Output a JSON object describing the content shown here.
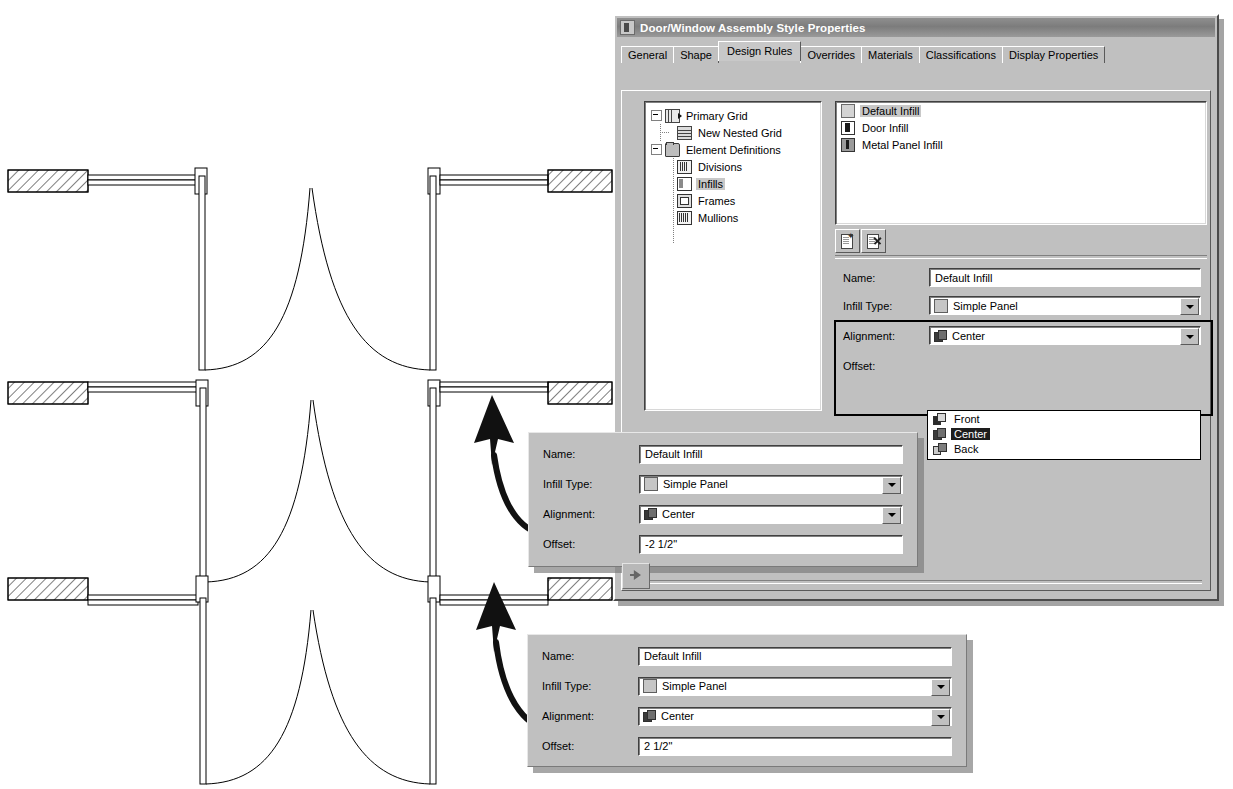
{
  "dialog": {
    "title": "Door/Window Assembly Style Properties",
    "title_icon": "door-window-assembly-icon",
    "tabs": [
      {
        "label": "General",
        "active": false
      },
      {
        "label": "Shape",
        "active": false
      },
      {
        "label": "Design Rules",
        "active": true
      },
      {
        "label": "Overrides",
        "active": false
      },
      {
        "label": "Materials",
        "active": false
      },
      {
        "label": "Classifications",
        "active": false
      },
      {
        "label": "Display Properties",
        "active": false
      }
    ],
    "tree": {
      "nodes": [
        {
          "label": "Primary Grid",
          "icon": "primary-grid-icon",
          "depth": 0,
          "expander": "minus",
          "selected": false
        },
        {
          "label": "New Nested Grid",
          "icon": "nested-grid-icon",
          "depth": 1,
          "expander": "none",
          "selected": false
        },
        {
          "label": "Element Definitions",
          "icon": "folder-icon",
          "depth": 0,
          "expander": "minus",
          "selected": false
        },
        {
          "label": "Divisions",
          "icon": "divisions-icon",
          "depth": 1,
          "expander": "none",
          "selected": false
        },
        {
          "label": "Infills",
          "icon": "infills-icon",
          "depth": 1,
          "expander": "none",
          "selected": true
        },
        {
          "label": "Frames",
          "icon": "frames-icon",
          "depth": 1,
          "expander": "none",
          "selected": false
        },
        {
          "label": "Mullions",
          "icon": "mullions-icon",
          "depth": 1,
          "expander": "none",
          "selected": false
        }
      ]
    },
    "list": {
      "items": [
        {
          "label": "Default Infill",
          "icon": "default-infill-icon",
          "selected": true
        },
        {
          "label": "Door Infill",
          "icon": "door-infill-icon",
          "selected": false
        },
        {
          "label": "Metal Panel Infill",
          "icon": "metal-panel-infill-icon",
          "selected": false
        }
      ]
    },
    "toolbar": {
      "new_label": "New",
      "delete_label": "Delete"
    },
    "form": {
      "name_label": "Name:",
      "name_value": "Default Infill",
      "infill_type_label": "Infill Type:",
      "infill_type_value": "Simple Panel",
      "alignment_label": "Alignment:",
      "alignment_value": "Center",
      "offset_label": "Offset:",
      "offset_value": "",
      "alignment_options": [
        {
          "label": "Front",
          "icon": "align-front-icon",
          "selected": false
        },
        {
          "label": "Center",
          "icon": "align-center-icon",
          "selected": true
        },
        {
          "label": "Back",
          "icon": "align-back-icon",
          "selected": false
        }
      ]
    }
  },
  "callouts": [
    {
      "name_label": "Name:",
      "name_value": "Default Infill",
      "infill_type_label": "Infill Type:",
      "infill_type_value": "Simple Panel",
      "alignment_label": "Alignment:",
      "alignment_value": "Center",
      "offset_label": "Offset:",
      "offset_value": "-2 1/2\""
    },
    {
      "name_label": "Name:",
      "name_value": "Default Infill",
      "infill_type_label": "Infill Type:",
      "infill_type_value": "Simple Panel",
      "alignment_label": "Alignment:",
      "alignment_value": "Center",
      "offset_label": "Offset:",
      "offset_value": "2 1/2\""
    }
  ],
  "drawing": {
    "type": "cad-plan-double-door",
    "views": [
      {
        "caption": "",
        "offset_state": "centered"
      },
      {
        "caption": "",
        "offset_state": "negative-offset"
      },
      {
        "caption": "",
        "offset_state": "positive-offset"
      }
    ]
  },
  "colors": {
    "dialog_face": "#c0c0c0",
    "titlebar": "#7c7c7c",
    "selection": "#1d1d1d",
    "tree_selection": "#c8c8c8",
    "field_bg": "#ffffff",
    "shadow": "#787878"
  }
}
